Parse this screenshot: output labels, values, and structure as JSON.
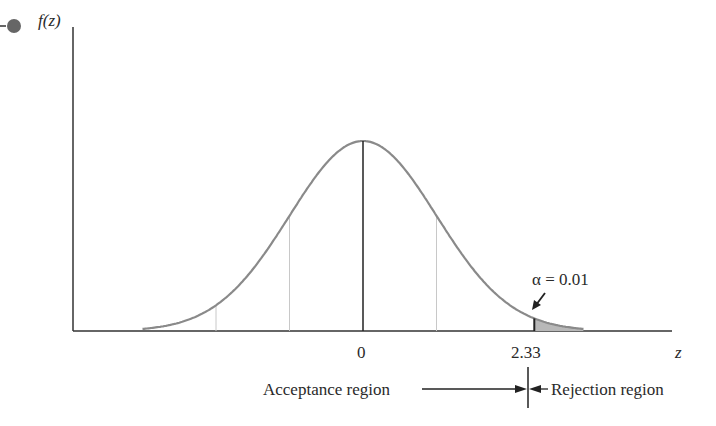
{
  "chart_data": {
    "type": "area",
    "title": "",
    "xlabel": "z",
    "ylabel": "f(z)",
    "distribution": "standard normal",
    "x_ticks": [
      "0",
      "2.33"
    ],
    "critical_value": 2.33,
    "alpha": 0.01,
    "alpha_label": "α = 0.01",
    "shaded_region": {
      "from": 2.33,
      "to": 3.0,
      "tail": "upper"
    },
    "reference_lines_sigma": [
      -2,
      -1,
      0,
      1
    ],
    "regions": [
      {
        "label": "Acceptance region",
        "side": "left"
      },
      {
        "label": "Rejection region",
        "side": "right"
      }
    ],
    "grid": false,
    "legend": "none"
  },
  "labels": {
    "y_axis": "f(z)",
    "x_axis": "z",
    "tick_zero": "0",
    "tick_critical": "2.33",
    "alpha": "α = 0.01",
    "acceptance": "Acceptance region",
    "rejection": "Rejection region"
  },
  "colors": {
    "curve": "#8a8a8a",
    "axis": "#333333",
    "shade": "#b8b8b8",
    "marker": "#666666"
  }
}
